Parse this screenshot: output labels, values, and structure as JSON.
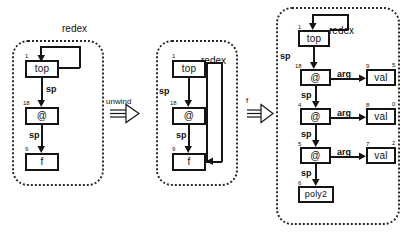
{
  "diagram": {
    "background": "#ffffff",
    "ink": "#151515",
    "panel_border": "#2a2a2a"
  },
  "transitions": [
    {
      "id": "unwind",
      "label": "unwind"
    },
    {
      "id": "apply-f",
      "label": "f"
    }
  ],
  "panels": [
    {
      "id": "state-1",
      "nodes": [
        {
          "id": "top1",
          "label": "top",
          "num": "1"
        },
        {
          "id": "at1",
          "label": "@",
          "num": "18"
        },
        {
          "id": "f1",
          "label": "f",
          "num": "9"
        }
      ],
      "edges": [
        {
          "from": "top1",
          "to": "at1",
          "label": "sp"
        },
        {
          "from": "at1",
          "to": "f1",
          "label": "sp"
        }
      ],
      "tags": [
        {
          "id": "redex1",
          "label": "redex",
          "points_to": "top1"
        }
      ]
    },
    {
      "id": "state-2",
      "nodes": [
        {
          "id": "top2",
          "label": "top",
          "num": "1"
        },
        {
          "id": "at2",
          "label": "@",
          "num": "18"
        },
        {
          "id": "f2",
          "label": "f",
          "num": "9"
        }
      ],
      "edges": [
        {
          "from": "top2",
          "to": "at2",
          "label": "sp"
        },
        {
          "from": "at2",
          "to": "f2",
          "label": "sp"
        }
      ],
      "tags": [
        {
          "id": "redex2",
          "label": "redex",
          "points_to": "f2"
        }
      ]
    },
    {
      "id": "state-3",
      "nodes": [
        {
          "id": "top3",
          "label": "top",
          "num": "1"
        },
        {
          "id": "at3a",
          "label": "@",
          "num": "18"
        },
        {
          "id": "val3a",
          "label": "val",
          "num": "9",
          "num2": "5"
        },
        {
          "id": "at3b",
          "label": "@",
          "num": "4"
        },
        {
          "id": "val3b",
          "label": "val",
          "num": "8",
          "num2": "0"
        },
        {
          "id": "at3c",
          "label": "@",
          "num": "5"
        },
        {
          "id": "val3c",
          "label": "val",
          "num": "7",
          "num2": "2"
        },
        {
          "id": "poly3",
          "label": "poly2",
          "num": "6"
        }
      ],
      "edges": [
        {
          "from": "top3",
          "to": "at3a",
          "label": "sp"
        },
        {
          "from": "at3a",
          "to": "val3a",
          "label": "arg"
        },
        {
          "from": "at3a",
          "to": "at3b",
          "label": "sp"
        },
        {
          "from": "at3b",
          "to": "val3b",
          "label": "arg"
        },
        {
          "from": "at3b",
          "to": "at3c",
          "label": "sp"
        },
        {
          "from": "at3c",
          "to": "val3c",
          "label": "arg"
        },
        {
          "from": "at3c",
          "to": "poly3",
          "label": "sp"
        }
      ],
      "tags": [
        {
          "id": "redex3",
          "label": "redex",
          "points_to": "top3"
        }
      ]
    }
  ]
}
